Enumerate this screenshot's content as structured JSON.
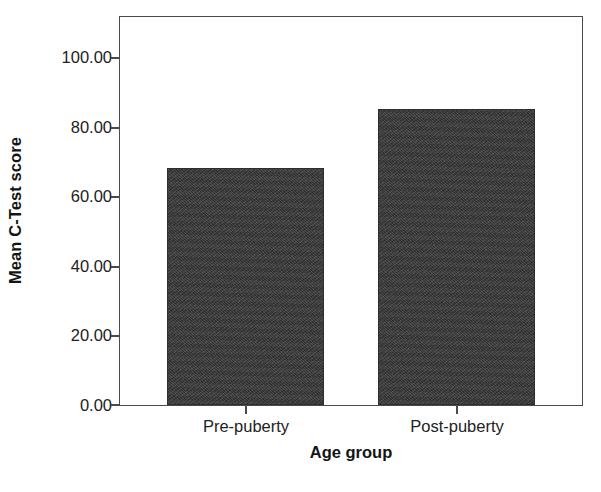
{
  "chart_data": {
    "type": "bar",
    "title": "",
    "subtitle": "",
    "xlabel": "Age group",
    "ylabel": "Mean C-Test score",
    "categories": [
      "Pre-puberty",
      "Post-puberty"
    ],
    "values": [
      68.5,
      85.5
    ],
    "ylim": [
      0,
      112
    ],
    "ytick_values": [
      0,
      20,
      40,
      60,
      80,
      100
    ],
    "ytick_labels": [
      "0.00",
      "20.00",
      "40.00",
      "60.00",
      "80.00",
      "100.00"
    ],
    "grid": false,
    "legend": null,
    "legend_position": "none",
    "bar_color": "#3b3b3b",
    "axis_color": "#4a4a4a",
    "background_color": "#ffffff",
    "annotations": []
  },
  "axes": {
    "y_title": "Mean C-Test score",
    "x_title": "Age group"
  }
}
